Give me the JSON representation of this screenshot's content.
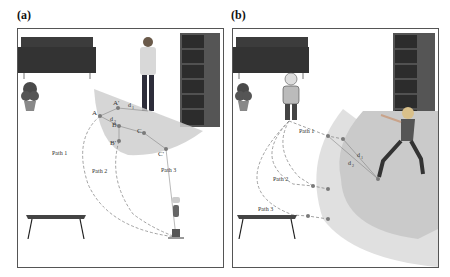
{
  "panels": [
    {
      "id": "a",
      "label": "(a)",
      "points": {
        "A": "A",
        "A_prime": "A'",
        "B": "B",
        "B_prime": "B'",
        "C": "C",
        "C_prime": "C'"
      },
      "distances": {
        "d1": "d",
        "d1_sub": "1",
        "d2": "d",
        "d2_sub": "2"
      },
      "paths": [
        "Path 1",
        "Path 2",
        "Path 3"
      ],
      "objects": [
        "sofa",
        "plant",
        "person-standing",
        "bookshelf",
        "table",
        "robot"
      ]
    },
    {
      "id": "b",
      "label": "(b)",
      "distances": {
        "d1": "d",
        "d1_sub": "1",
        "d2": "d",
        "d2_sub": "2"
      },
      "paths": [
        "Path 1",
        "Path 2",
        "Path 3"
      ],
      "objects": [
        "sofa",
        "plant",
        "robot",
        "bookshelf",
        "person-exercising",
        "table"
      ]
    }
  ],
  "colors": {
    "zone_outer": "#dcdcdc",
    "zone_inner": "#c4c4c4",
    "path_line": "#8a8a8a",
    "point": "#7a7a7a",
    "furniture_dark": "#3a3a3a",
    "shelf": "#5a5a5a"
  }
}
